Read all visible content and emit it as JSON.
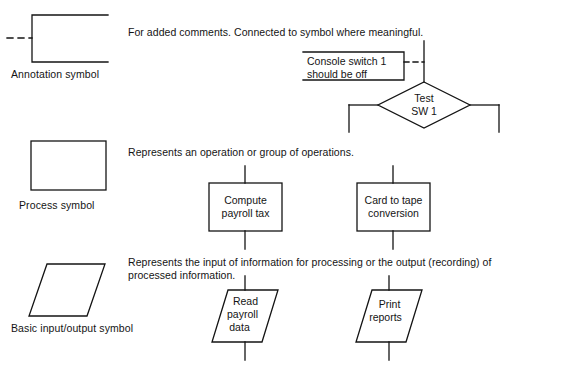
{
  "page": {
    "background_color": "#ffffff",
    "ink_color": "#141414"
  },
  "rows": [
    {
      "id": "annotation",
      "caption": "Annotation symbol",
      "description": "For added comments. Connected to symbol where meaningful.",
      "example": {
        "note_line1": "Console switch 1",
        "note_line2": "should be off",
        "decision_line1": "Test",
        "decision_line2": "SW 1"
      }
    },
    {
      "id": "process",
      "caption": "Process symbol",
      "description": "Represents an operation or group of operations.",
      "examples": [
        {
          "line1": "Compute",
          "line2": "payroll tax"
        },
        {
          "line1": "Card to tape",
          "line2": "conversion"
        }
      ]
    },
    {
      "id": "input-output",
      "caption": "Basic input/output symbol",
      "description_line1": "Represents the input of information for processing or the output (recording) of",
      "description_line2": "processed information.",
      "examples": [
        {
          "line1": "Read",
          "line2": "payroll",
          "line3": "data"
        },
        {
          "line1": "Print",
          "line2": "reports"
        }
      ]
    }
  ]
}
